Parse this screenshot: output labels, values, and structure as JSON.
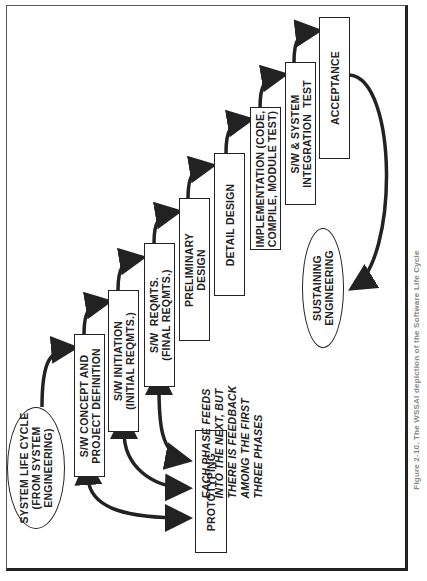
{
  "diagram": {
    "title_caption": "Figure 2-10. The WSSAI depiction of the Software Life Cycle",
    "start_node": "SYSTEM LIFE CYCLE\n(FROM SYSTEM\nENGINEERING)",
    "end_node": "SUSTAINING\nENGINEERING",
    "phases": [
      {
        "label": "S/W CONCEPT AND\nPROJECT DEFINITION"
      },
      {
        "label": "S/W INITIATION\n(INITIAL REQMTS.)"
      },
      {
        "label": "S/W  REQMTS.\n(FINAL REQMTS.)"
      },
      {
        "label": "PRELIMINARY\nDESIGN"
      },
      {
        "label": "DETAIL DESIGN"
      },
      {
        "label": "IMPLEMENTATION (CODE,\nCOMPILE, MODULE TEST)"
      },
      {
        "label": "S/W & SYSTEM\nINTEGRATION  TEST"
      },
      {
        "label": "ACCEPTANCE"
      }
    ],
    "prototyping": "PROTOTYPING",
    "note": "EACH PHASE FEEDS\nINTO THE NEXT, BUT\nTHERE IS FEEDBACK\nAMONG THE FIRST\nTHREE PHASES",
    "colors": {
      "ink": "#222222",
      "paper": "#ffffff"
    }
  }
}
